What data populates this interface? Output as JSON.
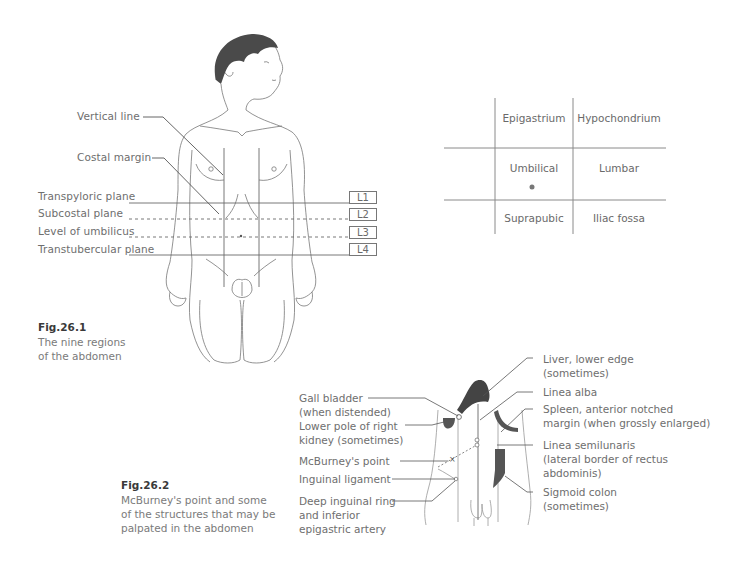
{
  "figure1": {
    "number": "Fig.26.1",
    "caption_lines": [
      "The nine regions",
      "of the abdomen"
    ],
    "callouts": {
      "vertical_line": "Vertical line",
      "costal_margin": "Costal margin"
    },
    "planes": [
      {
        "label": "Transpyloric plane",
        "level": "L1",
        "style": "solid"
      },
      {
        "label": "Subcostal plane",
        "level": "L2",
        "style": "dashed"
      },
      {
        "label": "Level of umbilicus",
        "level": "L3",
        "style": "dashed"
      },
      {
        "label": "Transtubercular plane",
        "level": "L4",
        "style": "solid"
      }
    ],
    "regions_grid": {
      "rows": [
        [
          "Epigastrium",
          "Hypochondrium"
        ],
        [
          "Umbilical",
          "Lumbar"
        ],
        [
          "Suprapubic",
          "Iliac fossa"
        ]
      ]
    }
  },
  "figure2": {
    "number": "Fig.26.2",
    "caption_lines": [
      "McBurney's point and some",
      "of the structures that may be",
      "palpated in the abdomen"
    ],
    "left_labels": [
      {
        "lines": [
          "Gall bladder",
          "(when distended)"
        ]
      },
      {
        "lines": [
          "Lower pole of right",
          "kidney (sometimes)"
        ]
      },
      {
        "lines": [
          "McBurney's point"
        ]
      },
      {
        "lines": [
          "Inguinal ligament"
        ]
      },
      {
        "lines": [
          "Deep inguinal ring",
          "and inferior",
          "epigastric artery"
        ]
      }
    ],
    "right_labels": [
      {
        "lines": [
          "Liver, lower edge",
          "(sometimes)"
        ]
      },
      {
        "lines": [
          "Linea alba"
        ]
      },
      {
        "lines": [
          "Spleen, anterior notched",
          "margin (when grossly enlarged)"
        ]
      },
      {
        "lines": [
          "Linea semilunaris",
          "(lateral border of rectus",
          "abdominis)"
        ]
      },
      {
        "lines": [
          "Sigmoid colon",
          "(sometimes)"
        ]
      }
    ]
  },
  "colors": {
    "line": "#6f6f6f",
    "hair": "#4a4a4a",
    "organ_fill": "#555555",
    "text": "#6e6e6e"
  }
}
